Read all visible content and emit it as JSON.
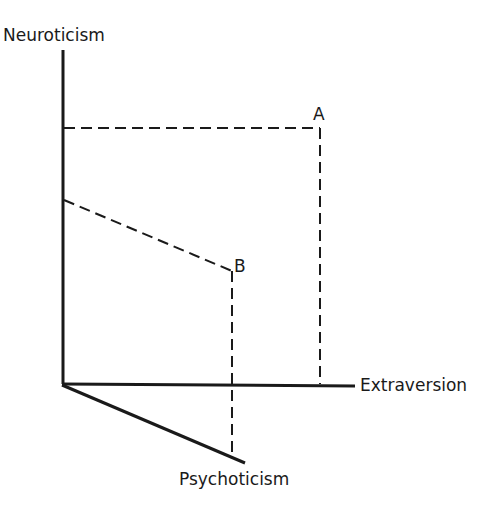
{
  "diagram": {
    "type": "3d-personality-dimensions",
    "colors": {
      "ink": "#1a1a1a",
      "background": "#ffffff"
    },
    "axes": {
      "vertical": {
        "label": "Neuroticism"
      },
      "horizontal": {
        "label": "Extraversion"
      },
      "depth": {
        "label": "Psychoticism"
      }
    },
    "points": [
      {
        "label": "A"
      },
      {
        "label": "B"
      }
    ]
  }
}
